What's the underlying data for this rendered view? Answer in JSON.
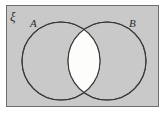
{
  "figure": {
    "type": "venn-diagram",
    "universal_set_label": "ξ",
    "set_a_label": "A",
    "set_b_label": "B",
    "shaded_region": "A ∩ B",
    "colors": {
      "page_background": "#ffffff",
      "universe_fill": "#c9c9c9",
      "universe_border": "#6e6e6e",
      "circle_stroke": "#3a3a3a",
      "intersection_fill": "#fdfdfb",
      "label_color": "#2b2b2b"
    },
    "geometry": {
      "rect": {
        "x": 6,
        "y": 5,
        "width": 153,
        "height": 102
      },
      "circle_a": {
        "cx": 61,
        "cy": 61,
        "r": 39
      },
      "circle_b": {
        "cx": 107,
        "cy": 61,
        "r": 39
      },
      "label_a_pos": {
        "x": 31,
        "y": 26
      },
      "label_b_pos": {
        "x": 130,
        "y": 26
      },
      "label_universal_pos": {
        "x": 10,
        "y": 20
      }
    }
  }
}
